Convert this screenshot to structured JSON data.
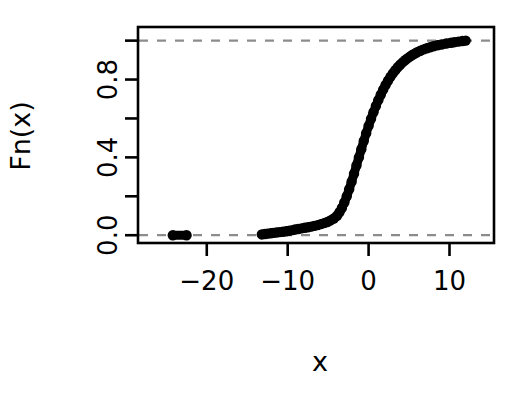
{
  "figure": {
    "kind": "ecdf-plot",
    "background_color": "#ffffff",
    "ink_color": "#000000",
    "reference_line_color": "#8c8c8c"
  },
  "axes": {
    "x_axis_label": "x",
    "y_axis_label": "Fn(x)",
    "x_tick_labels": [
      "-20",
      "-10",
      "0",
      "10"
    ],
    "x_tick_values": [
      -20,
      -10,
      0,
      10
    ],
    "y_tick_labels": [
      "0.0",
      "",
      "0.4",
      "",
      "0.8",
      ""
    ],
    "y_tick_values": [
      0.0,
      0.2,
      0.4,
      0.6,
      0.8,
      1.0
    ]
  },
  "chart_data": {
    "type": "line",
    "title": "",
    "subtitle": "",
    "xlabel": "x",
    "ylabel": "Fn(x)",
    "xlim": [
      -28.5,
      15.5
    ],
    "ylim": [
      -0.04,
      1.07
    ],
    "grid": false,
    "legend": "none",
    "x_ticks": [
      -20,
      -10,
      0,
      10
    ],
    "x_tick_labels": [
      "-20",
      "-10",
      "0",
      "10"
    ],
    "y_ticks": [
      0.0,
      0.2,
      0.4,
      0.6,
      0.8,
      1.0
    ],
    "y_tick_labels": [
      "0.0",
      "",
      "0.4",
      "",
      "0.8",
      ""
    ],
    "annotations": [
      {
        "name": "upper-reference-line",
        "type": "hline",
        "y": 1.0,
        "style": "dashed",
        "color": "#8c8c8c"
      },
      {
        "name": "lower-reference-line",
        "type": "hline",
        "y": 0.0,
        "style": "dashed",
        "color": "#8c8c8c"
      }
    ],
    "series": [
      {
        "name": "ECDF",
        "marker": "filled-circle",
        "x": [
          -24.2,
          -22.5,
          -13.2,
          -12.8,
          -12.5,
          -12.1,
          -11.8,
          -11.4,
          -11.0,
          -10.6,
          -10.2,
          -9.8,
          -9.4,
          -9.1,
          -8.7,
          -8.3,
          -7.9,
          -7.5,
          -7.1,
          -6.7,
          -6.3,
          -5.9,
          -5.5,
          -5.1,
          -4.7,
          -4.3,
          -3.9,
          -3.6,
          -3.3,
          -3.0,
          -2.7,
          -2.4,
          -2.1,
          -1.8,
          -1.5,
          -1.2,
          -0.9,
          -0.6,
          -0.3,
          0.0,
          0.3,
          0.6,
          0.9,
          1.2,
          1.5,
          1.8,
          2.1,
          2.4,
          2.7,
          3.0,
          3.3,
          3.6,
          3.9,
          4.2,
          4.5,
          4.8,
          5.1,
          5.4,
          5.7,
          6.0,
          6.4,
          6.8,
          7.2,
          7.6,
          8.0,
          8.5,
          9.0,
          9.6,
          10.2,
          10.6,
          11.1,
          11.6,
          12.0
        ],
        "y": [
          0.0,
          0.0,
          0.004,
          0.006,
          0.008,
          0.01,
          0.012,
          0.014,
          0.016,
          0.018,
          0.02,
          0.023,
          0.026,
          0.029,
          0.032,
          0.035,
          0.038,
          0.041,
          0.044,
          0.048,
          0.052,
          0.057,
          0.062,
          0.068,
          0.076,
          0.086,
          0.1,
          0.118,
          0.14,
          0.168,
          0.2,
          0.236,
          0.275,
          0.316,
          0.358,
          0.4,
          0.442,
          0.484,
          0.524,
          0.562,
          0.598,
          0.632,
          0.664,
          0.694,
          0.722,
          0.748,
          0.772,
          0.794,
          0.814,
          0.832,
          0.848,
          0.863,
          0.876,
          0.888,
          0.899,
          0.909,
          0.918,
          0.926,
          0.933,
          0.94,
          0.948,
          0.955,
          0.961,
          0.966,
          0.971,
          0.976,
          0.98,
          0.985,
          0.989,
          0.992,
          0.995,
          0.998,
          1.0
        ]
      }
    ]
  }
}
